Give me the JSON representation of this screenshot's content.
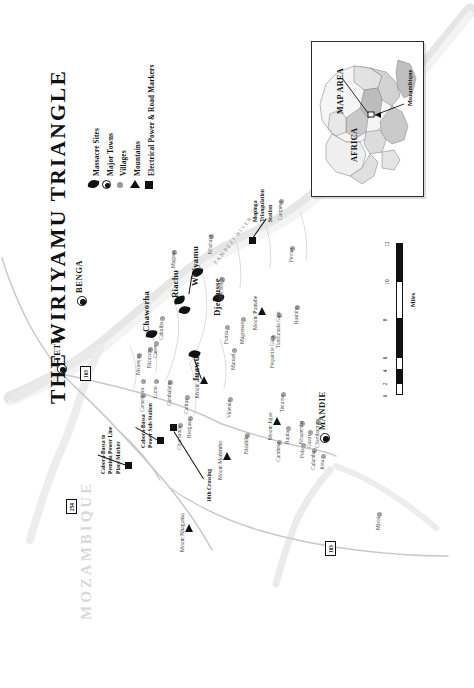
{
  "map": {
    "title": "THE WIRIYAMU TRIANGLE",
    "orientation": "rotated-90-ccw",
    "country_watermark": "MOZAMBIQUE",
    "river_label": "ZAMBEZI RIVER",
    "background": "#ffffff"
  },
  "legend": {
    "items": [
      {
        "label": "Massacre Sites",
        "icon": "diamond-marker-icon",
        "color": "#111111"
      },
      {
        "label": "Major Towns",
        "icon": "circle-dot-icon",
        "color": "#111111"
      },
      {
        "label": "Villages",
        "icon": "small-dot-icon",
        "color": "#9a9a9a"
      },
      {
        "label": "Mountains",
        "icon": "triangle-icon",
        "color": "#111111"
      },
      {
        "label": "Electrical Power & Road Markers",
        "icon": "square-icon",
        "color": "#111111"
      }
    ]
  },
  "inset": {
    "map_area_label": "MAP AREA",
    "continent_label": "AFRICA",
    "country_label": "Mozambique"
  },
  "scale": {
    "unit_label": "Miles",
    "ticks": [
      "0",
      "2",
      "4",
      "6",
      "8",
      "10",
      "12"
    ]
  },
  "major_towns": [
    {
      "name": "TETE",
      "x": 62,
      "y": 369
    },
    {
      "name": "BENGA",
      "x": 82,
      "y": 300
    },
    {
      "name": "MANDIE",
      "x": 325,
      "y": 437
    }
  ],
  "massacre_sites": [
    {
      "name": "Chaworha",
      "x": 151,
      "y": 334
    },
    {
      "name": "Riachu",
      "x": 178,
      "y": 300
    },
    {
      "name": "Wiriyamu",
      "x": 196,
      "y": 272
    },
    {
      "name": "Djemusse",
      "x": 215,
      "y": 306
    },
    {
      "name": "Juawu",
      "x": 193,
      "y": 356
    }
  ],
  "villages": [
    {
      "name": "Nicuequa",
      "x": 141,
      "y": 357
    },
    {
      "name": "Cuere",
      "x": 157,
      "y": 344
    },
    {
      "name": "Soca",
      "x": 145,
      "y": 383
    },
    {
      "name": "Lumi",
      "x": 158,
      "y": 383
    },
    {
      "name": "Cambalame",
      "x": 172,
      "y": 384
    },
    {
      "name": "Cabuiba",
      "x": 163,
      "y": 320
    },
    {
      "name": "Magoua",
      "x": 176,
      "y": 254
    },
    {
      "name": "Nhahuze",
      "x": 213,
      "y": 238
    },
    {
      "name": "Mechengo",
      "x": 224,
      "y": 281
    },
    {
      "name": "Funda",
      "x": 229,
      "y": 329
    },
    {
      "name": "Manuel",
      "x": 236,
      "y": 352
    },
    {
      "name": "Magonsse",
      "x": 245,
      "y": 321
    },
    {
      "name": "Tundumula Galo",
      "x": 281,
      "y": 317
    },
    {
      "name": "Fequerire Gala",
      "x": 275,
      "y": 339
    },
    {
      "name": "Ferrao",
      "x": 294,
      "y": 250
    },
    {
      "name": "Rasinho",
      "x": 299,
      "y": 309
    },
    {
      "name": "Caripesa",
      "x": 283,
      "y": 203
    },
    {
      "name": "Camera",
      "x": 145,
      "y": 397
    },
    {
      "name": "Chuchanda",
      "x": 182,
      "y": 427
    },
    {
      "name": "Caritas",
      "x": 189,
      "y": 399
    },
    {
      "name": "Vidende",
      "x": 232,
      "y": 401
    },
    {
      "name": "Nidabile",
      "x": 249,
      "y": 437
    },
    {
      "name": "Bengusa",
      "x": 192,
      "y": 420
    },
    {
      "name": "Tecuma",
      "x": 285,
      "y": 396
    },
    {
      "name": "Rupia",
      "x": 290,
      "y": 430
    },
    {
      "name": "Cumbeza",
      "x": 281,
      "y": 444
    },
    {
      "name": "Nhapemba",
      "x": 304,
      "y": 425
    },
    {
      "name": "Fola",
      "x": 305,
      "y": 447
    },
    {
      "name": "Culamba",
      "x": 316,
      "y": 452
    },
    {
      "name": "Gsuni",
      "x": 312,
      "y": 434
    },
    {
      "name": "Chambumura",
      "x": 320,
      "y": 424
    },
    {
      "name": "Jima",
      "x": 325,
      "y": 458
    },
    {
      "name": "Mivui",
      "x": 381,
      "y": 516
    },
    {
      "name": "Nicurapa",
      "x": 152,
      "y": 351
    }
  ],
  "mountains": [
    {
      "name": "Mount Pumabe",
      "x": 262,
      "y": 311
    },
    {
      "name": "Mount Jajue",
      "x": 277,
      "y": 421
    },
    {
      "name": "Mount Nhagunsa",
      "x": 189,
      "y": 528
    },
    {
      "name": "Mount Madembo",
      "x": 227,
      "y": 456
    },
    {
      "name": "Mount Awize",
      "x": 204,
      "y": 380
    }
  ],
  "markers": [
    {
      "name": "Mopinga Triangulation Station",
      "label": "Mopinga\nTriangulation\nStation",
      "type": "square",
      "x": 252,
      "y": 240
    },
    {
      "name": "Cabora-Bassa Power Sub-Station",
      "label": "Cabora-Bassa\nPower Sub-Station",
      "type": "square",
      "x": 160,
      "y": 440
    },
    {
      "name": "Cabora-Bassa to Pemisia Power Line Place Marker",
      "label": "Cabora-Bassa to\nPemisia Power Line\nPlace Marker",
      "type": "square",
      "x": 128,
      "y": 465
    },
    {
      "name": "18th Crossing",
      "label": "18th Crossing",
      "type": "square",
      "x": 197,
      "y": 488
    }
  ],
  "road_markers": [
    {
      "number": "103",
      "x": 84,
      "y": 372
    },
    {
      "number": "254",
      "x": 70,
      "y": 505
    },
    {
      "number": "103",
      "x": 329,
      "y": 547
    }
  ]
}
